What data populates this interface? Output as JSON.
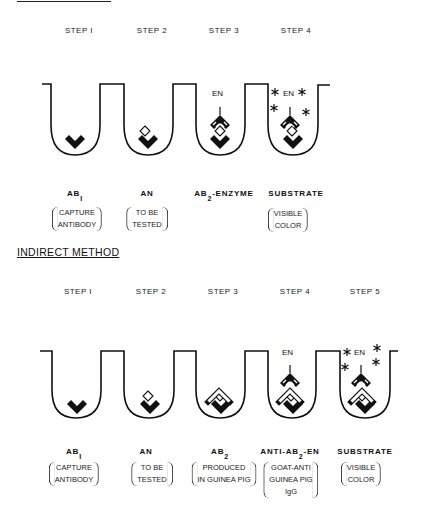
{
  "direct_method": {
    "title_underline_only": true,
    "steps": [
      "STEP I",
      "STEP 2",
      "STEP 3",
      "STEP 4"
    ],
    "reagents": [
      {
        "main": "AB",
        "sub": "I",
        "suffix": "",
        "desc": [
          "CAPTURE",
          "ANTIBODY"
        ]
      },
      {
        "main": "AN",
        "sub": "",
        "suffix": "",
        "desc": [
          "TO BE",
          "TESTED"
        ]
      },
      {
        "main": "AB",
        "sub": "2",
        "suffix": "-ENZYME",
        "desc": []
      },
      {
        "main": "SUBSTRATE",
        "sub": "",
        "suffix": "",
        "desc": [
          "VISIBLE",
          "COLOR"
        ]
      }
    ],
    "enzyme_label": "EN"
  },
  "indirect_method": {
    "title": "INDIRECT METHOD",
    "steps": [
      "STEP I",
      "STEP 2",
      "STEP 3",
      "STEP 4",
      "STEP 5"
    ],
    "reagents": [
      {
        "main": "AB",
        "sub": "I",
        "suffix": "",
        "desc": [
          "CAPTURE",
          "ANTIBODY"
        ]
      },
      {
        "main": "AN",
        "sub": "",
        "suffix": "",
        "desc": [
          "TO BE",
          "TESTED"
        ]
      },
      {
        "main": "AB",
        "sub": "2",
        "suffix": "",
        "desc": [
          "PRODUCED",
          "IN GUINEA PIG"
        ]
      },
      {
        "main": "ANTI-AB",
        "sub": "2",
        "suffix": "-EN",
        "desc": [
          "GOAT-ANTI",
          "GUINEA PIG",
          "IgG"
        ]
      },
      {
        "main": "SUBSTRATE",
        "sub": "",
        "suffix": "",
        "desc": [
          "VISIBLE",
          "COLOR"
        ]
      }
    ],
    "enzyme_label": "EN"
  }
}
